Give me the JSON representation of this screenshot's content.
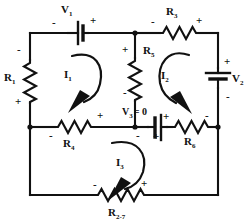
{
  "diagram": {
    "type": "electrical-circuit-schematic",
    "ink_color": "#111111",
    "background_color": "#ffffff"
  },
  "components": {
    "r1": {
      "label": "R",
      "sub": "1",
      "kind": "resistor",
      "orientation": "vertical",
      "plus": "bottom",
      "minus": "top"
    },
    "r3": {
      "label": "R",
      "sub": "3",
      "kind": "resistor",
      "orientation": "horizontal",
      "plus": "right",
      "minus": "left"
    },
    "r4": {
      "label": "R",
      "sub": "4",
      "kind": "resistor",
      "orientation": "horizontal",
      "plus": "right",
      "minus": "left"
    },
    "r5": {
      "label": "R",
      "sub": "5",
      "kind": "resistor",
      "orientation": "vertical",
      "plus": "top",
      "minus": "bottom"
    },
    "r6": {
      "label": "R",
      "sub": "6",
      "kind": "resistor",
      "orientation": "horizontal",
      "plus": "left",
      "minus": "right"
    },
    "r27": {
      "label": "R",
      "sub": "2-7",
      "kind": "resistor",
      "orientation": "horizontal",
      "plus": "right",
      "minus": "left"
    },
    "v1": {
      "label": "V",
      "sub": "1",
      "kind": "battery",
      "orientation": "horizontal",
      "plus": "right",
      "minus": "left"
    },
    "v2": {
      "label": "V",
      "sub": "2",
      "kind": "battery",
      "orientation": "vertical",
      "plus": "top",
      "minus": "bottom"
    },
    "v3": {
      "label": "V",
      "sub": "3",
      "kind": "battery",
      "orientation": "horizontal",
      "plus": "right",
      "minus": "left",
      "value_text": "= 0"
    }
  },
  "currents": {
    "i1": {
      "label": "I",
      "sub": "1",
      "direction": "counter-clockwise",
      "mesh": "left"
    },
    "i2": {
      "label": "I",
      "sub": "2",
      "direction": "clockwise",
      "mesh": "upper-right"
    },
    "i3": {
      "label": "I",
      "sub": "3",
      "direction": "counter-clockwise",
      "mesh": "bottom"
    }
  },
  "polarity_marks": {
    "plus": "+",
    "minus": "-"
  }
}
